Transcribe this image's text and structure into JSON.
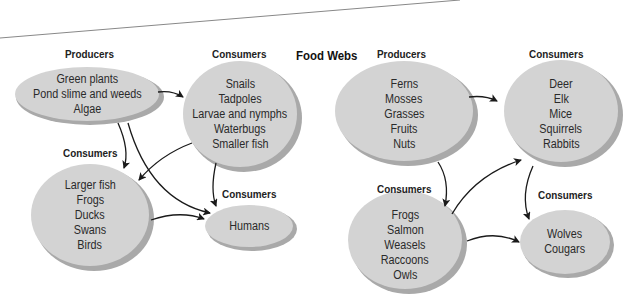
{
  "title": "Food Webs",
  "colors": {
    "ellipse_fill": "#d3d3d3",
    "ellipse_shadow": "#a9a9a9",
    "arrow": "#1a1a1a",
    "text": "#2a2a2a"
  },
  "web1": {
    "producers": {
      "label": "Producers",
      "items": [
        "Green plants",
        "Pond slime and weeds",
        "Algae"
      ]
    },
    "consumers_primary": {
      "label": "Consumers",
      "items": [
        "Snails",
        "Tadpoles",
        "Larvae and nymphs",
        "Waterbugs",
        "Smaller fish"
      ]
    },
    "consumers_secondary": {
      "label": "Consumers",
      "items": [
        "Larger fish",
        "Frogs",
        "Ducks",
        "Swans",
        "Birds"
      ]
    },
    "consumers_top": {
      "label": "Consumers",
      "items": [
        "Humans"
      ]
    }
  },
  "web2": {
    "producers": {
      "label": "Producers",
      "items": [
        "Ferns",
        "Mosses",
        "Grasses",
        "Fruits",
        "Nuts"
      ]
    },
    "consumers_primary": {
      "label": "Consumers",
      "items": [
        "Deer",
        "Elk",
        "Mice",
        "Squirrels",
        "Rabbits"
      ]
    },
    "consumers_secondary": {
      "label": "Consumers",
      "items": [
        "Frogs",
        "Salmon",
        "Weasels",
        "Raccoons",
        "Owls"
      ]
    },
    "consumers_top": {
      "label": "Consumers",
      "items": [
        "Wolves",
        "Cougars"
      ]
    }
  }
}
